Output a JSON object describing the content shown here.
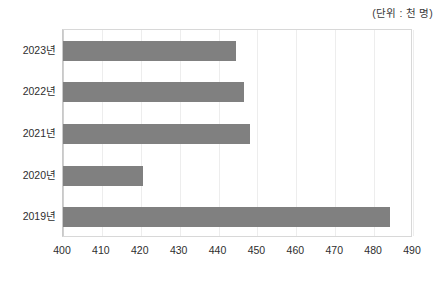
{
  "annotation": {
    "unit_note": "(단위 : 천 명)"
  },
  "chart_data": {
    "type": "bar",
    "orientation": "horizontal",
    "title": "",
    "xlabel": "",
    "ylabel": "",
    "categories": [
      "2023년",
      "2022년",
      "2021년",
      "2020년",
      "2019년"
    ],
    "values": [
      444.5,
      446.5,
      448,
      420.5,
      484
    ],
    "series": [
      {
        "name": "",
        "values": [
          444.5,
          446.5,
          448,
          420.5,
          484
        ]
      }
    ],
    "xlim": [
      400,
      490
    ],
    "xticks": [
      400,
      410,
      420,
      430,
      440,
      450,
      460,
      470,
      480,
      490
    ],
    "xtick_labels": [
      "400",
      "410",
      "420",
      "430",
      "440",
      "450",
      "460",
      "470",
      "480",
      "490"
    ],
    "grid": "vertical",
    "legend": "none",
    "bar_color": "#808080",
    "gridline_color": "#ededed",
    "axis_color": "#d0d0d0",
    "background": "#ffffff",
    "unit_note": "(단위 : 천 명)"
  }
}
